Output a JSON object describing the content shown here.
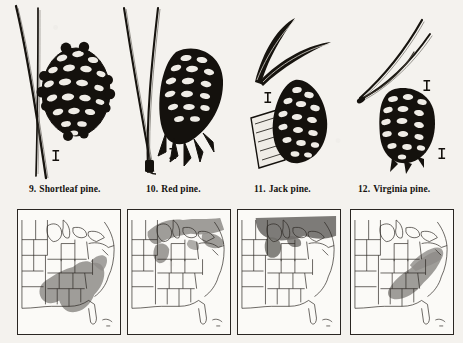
{
  "plate": {
    "title": "Pine species identification plate",
    "background_color": "#f4f2ee",
    "ink_color": "#15120f"
  },
  "specimens": [
    {
      "number": "9.",
      "name": "Shortleaf pine.",
      "caption": "9.  Shortleaf pine.",
      "needles": "two long slender needles, nearly straight, slightly curved",
      "cone": "small rounded ovoid cone, broad scales",
      "scale_marker": "scale-bar"
    },
    {
      "number": "10.",
      "name": "Red pine.",
      "caption": "10.  Red pine.",
      "needles": "two very long needles forming a narrow V",
      "cone": "elongated ovoid cone with spreading scales",
      "scale_marker": "scale-bar"
    },
    {
      "number": "11.",
      "name": "Jack pine.",
      "caption": "11.  Jack pine.",
      "needles": "two short stout curved needles spreading widely",
      "cone": "curved asymmetric cone attached to woody twig",
      "scale_marker": "scale-bar"
    },
    {
      "number": "12.",
      "name": "Virginia pine.",
      "caption": "12.  Virginia pine.",
      "needles": "two short twisted needles",
      "cone": "small narrow cone with prickled scales",
      "scale_marker": "scale-bar"
    }
  ],
  "maps": [
    {
      "for_species": "Shortleaf pine.",
      "region_label": "eastern United States",
      "range_description": "southeastern states from east Texas and Arkansas through the Gulf states, Appalachians, to New Jersey",
      "shade_color": "#8e8c88",
      "shade_opacity": 0.85
    },
    {
      "for_species": "Red pine.",
      "region_label": "eastern United States",
      "range_description": "northern Great Lakes, northern Minnesota and Wisconsin, Michigan, New England and adjacent Canada",
      "shade_color": "#8e8c88",
      "shade_opacity": 0.85
    },
    {
      "for_species": "Jack pine.",
      "region_label": "eastern United States",
      "range_description": "far northern Great Lakes region and across southern Canada into New England",
      "shade_color": "#6f6d69",
      "shade_opacity": 0.9
    },
    {
      "for_species": "Virginia pine.",
      "region_label": "eastern United States",
      "range_description": "central Appalachians, Virginia, Carolinas, Tennessee, Kentucky, Pennsylvania and New Jersey",
      "shade_color": "#8e8c88",
      "shade_opacity": 0.85
    }
  ],
  "map_geometry": {
    "outline_color": "#2a2622",
    "border_color": "#2a2622",
    "fill_color": "#fbfaf7"
  }
}
